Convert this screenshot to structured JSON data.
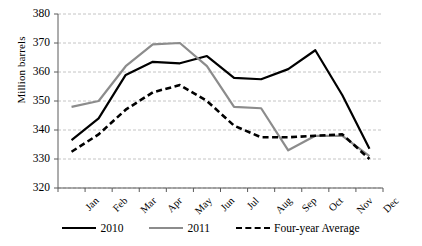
{
  "chart_data": {
    "type": "line",
    "title": "",
    "xlabel": "",
    "ylabel": "Million barrels",
    "ylim": [
      320,
      380
    ],
    "yticks": [
      320,
      330,
      340,
      350,
      360,
      370,
      380
    ],
    "grid": true,
    "legend_position": "bottom",
    "categories": [
      "Jan",
      "Feb",
      "Mar",
      "Apr",
      "May",
      "Jun",
      "Jul",
      "Aug",
      "Sep",
      "Oct",
      "Nov",
      "Dec"
    ],
    "series": [
      {
        "name": "2010",
        "color": "#000000",
        "style": "solid",
        "values": [
          336.5,
          344.0,
          359.0,
          363.5,
          363.0,
          365.5,
          358.0,
          357.5,
          361.0,
          367.5,
          352.0,
          333.5
        ]
      },
      {
        "name": "2011",
        "color": "#8c8c8c",
        "style": "solid",
        "values": [
          348.0,
          350.0,
          362.0,
          369.5,
          370.0,
          362.0,
          348.0,
          347.5,
          333.0,
          338.0,
          338.0,
          331.0
        ]
      },
      {
        "name": "Four-year Average",
        "color": "#000000",
        "style": "dashed",
        "values": [
          332.5,
          338.5,
          347.0,
          353.0,
          355.5,
          350.0,
          341.5,
          337.5,
          337.5,
          338.0,
          338.5,
          330.0
        ]
      }
    ]
  },
  "axes": {
    "y_title": "Million barrels",
    "y_tick_labels": [
      "380",
      "370",
      "360",
      "350",
      "340",
      "330",
      "320"
    ],
    "x_tick_labels": [
      "Jan",
      "Feb",
      "Mar",
      "Apr",
      "May",
      "Jun",
      "Jul",
      "Aug",
      "Sep",
      "Oct",
      "Nov",
      "Dec"
    ]
  },
  "legend": {
    "items": [
      {
        "label": "2010",
        "color": "#000000",
        "style": "solid"
      },
      {
        "label": "2011",
        "color": "#8c8c8c",
        "style": "solid"
      },
      {
        "label": "Four-year Average",
        "color": "#000000",
        "style": "dashed"
      }
    ]
  },
  "style": {
    "grid_color": "#b5b5b5",
    "axis_color": "#5a5a5a",
    "plot_background": "#ffffff"
  }
}
